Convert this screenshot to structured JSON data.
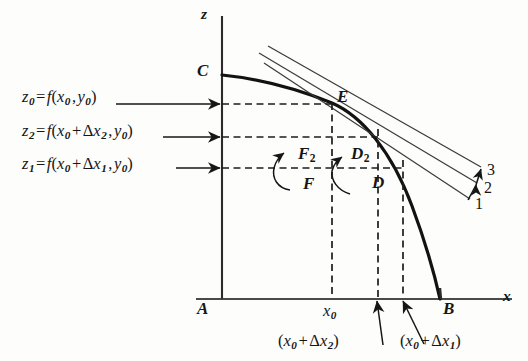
{
  "figure": {
    "kind": "calculus-secant-tangent-diagram",
    "background_color": "#fdfdfc",
    "ink_color": "#161616"
  },
  "axes": {
    "z_axis_label": "z",
    "x_axis_label": "x",
    "origin_label": "A",
    "x_axis_end_label": "B",
    "curve_start_label": "C"
  },
  "points": {
    "E": "E",
    "F": "F",
    "F2": {
      "base": "F",
      "sub": "2"
    },
    "D": "D",
    "D2": {
      "base": "D",
      "sub": "2"
    }
  },
  "equations": [
    {
      "id": "z0",
      "lhs_base": "z",
      "lhs_sub": "0",
      "eq": "=",
      "fn": "f",
      "open": "(",
      "arg1_base": "x",
      "arg1_sub": "0",
      "comma": ",",
      "arg2_base": "y",
      "arg2_sub": "0",
      "close": ")",
      "plus": "",
      "delta": "",
      "delta_base": "",
      "delta_sub": ""
    },
    {
      "id": "z2",
      "lhs_base": "z",
      "lhs_sub": "2",
      "eq": "=",
      "fn": "f",
      "open": "(",
      "arg1_base": "x",
      "arg1_sub": "0",
      "comma": ",",
      "arg2_base": "y",
      "arg2_sub": "0",
      "close": ")",
      "plus": "+",
      "delta": "Δ",
      "delta_base": "x",
      "delta_sub": "2"
    },
    {
      "id": "z1",
      "lhs_base": "z",
      "lhs_sub": "1",
      "eq": "=",
      "fn": "f",
      "open": "(",
      "arg1_base": "x",
      "arg1_sub": "0",
      "comma": ",",
      "arg2_base": "y",
      "arg2_sub": "0",
      "close": ")",
      "plus": "+",
      "delta": "Δ",
      "delta_base": "x",
      "delta_sub": "1"
    }
  ],
  "x_ticks": {
    "x0": {
      "base": "x",
      "sub": "0"
    },
    "x0_dx2": {
      "open": "(",
      "base": "x",
      "sub": "0",
      "plus": "+",
      "delta": "Δ",
      "dbase": "x",
      "dsub": "2",
      "close": ")"
    },
    "x0_dx1": {
      "open": "(",
      "base": "x",
      "sub": "0",
      "plus": "+",
      "delta": "Δ",
      "dbase": "x",
      "dsub": "1",
      "close": ")"
    }
  },
  "line_labels": [
    {
      "id": "line-1",
      "text": "1"
    },
    {
      "id": "line-2",
      "text": "2"
    },
    {
      "id": "line-3",
      "text": "3"
    }
  ]
}
